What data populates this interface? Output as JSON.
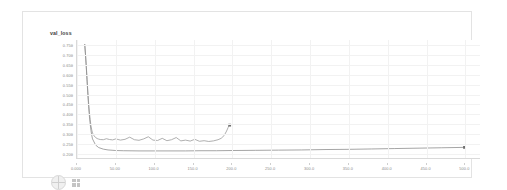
{
  "panel": {
    "name": "chart-card"
  },
  "footer": {
    "avatar_icon": "avatar-icon",
    "grid_icon": "grid-icon"
  },
  "chart_data": {
    "type": "line",
    "title": "val_loss",
    "xlabel": "",
    "ylabel": "",
    "grid": true,
    "legend": "none",
    "xlim": [
      0,
      520
    ],
    "ylim": [
      0.175,
      0.775
    ],
    "x_ticks": [
      0,
      50,
      100,
      150,
      200,
      250,
      300,
      350,
      400,
      450,
      500
    ],
    "x_tick_labels": [
      "0.000",
      "50.00",
      "100.0",
      "150.0",
      "200.0",
      "250.0",
      "300.0",
      "350.0",
      "400.0",
      "450.0",
      "500.0"
    ],
    "y_ticks": [
      0.75,
      0.7,
      0.65,
      0.6,
      0.55,
      0.5,
      0.45,
      0.4,
      0.35,
      0.3,
      0.25,
      0.2
    ],
    "y_tick_labels": [
      "0.750",
      "0.700",
      "0.650",
      "0.600",
      "0.550",
      "0.500",
      "0.450",
      "0.400",
      "0.350",
      "0.300",
      "0.250",
      "0.200"
    ],
    "series": [
      {
        "name": "run-a",
        "color": "#9a9a9a",
        "end_marker": true,
        "x": [
          10,
          11,
          12,
          13,
          14,
          15,
          16,
          17,
          18,
          19,
          20,
          22,
          24,
          26,
          28,
          30,
          34,
          38,
          42,
          46,
          50,
          56,
          62,
          68,
          74,
          80,
          86,
          92,
          98,
          104,
          110,
          116,
          122,
          128,
          134,
          140,
          146,
          152,
          158,
          164,
          170,
          176,
          182,
          186,
          190,
          193,
          195,
          196,
          197
        ],
        "y": [
          0.752,
          0.7,
          0.64,
          0.575,
          0.512,
          0.455,
          0.408,
          0.37,
          0.34,
          0.318,
          0.302,
          0.288,
          0.279,
          0.274,
          0.271,
          0.269,
          0.268,
          0.273,
          0.269,
          0.267,
          0.272,
          0.266,
          0.27,
          0.281,
          0.268,
          0.265,
          0.272,
          0.283,
          0.266,
          0.264,
          0.275,
          0.263,
          0.268,
          0.279,
          0.262,
          0.266,
          0.261,
          0.27,
          0.26,
          0.263,
          0.259,
          0.262,
          0.268,
          0.275,
          0.29,
          0.312,
          0.33,
          0.339,
          0.342
        ]
      },
      {
        "name": "run-b",
        "color": "#8e8e8e",
        "end_marker": true,
        "x": [
          10,
          11,
          12,
          13,
          14,
          15,
          16,
          17,
          18,
          19,
          20,
          24,
          28,
          34,
          40,
          50,
          60,
          80,
          100,
          120,
          140,
          160,
          180,
          200,
          230,
          260,
          290,
          320,
          350,
          380,
          410,
          440,
          470,
          500
        ],
        "y": [
          0.752,
          0.698,
          0.635,
          0.566,
          0.498,
          0.438,
          0.388,
          0.348,
          0.316,
          0.291,
          0.272,
          0.241,
          0.228,
          0.22,
          0.216,
          0.213,
          0.212,
          0.211,
          0.211,
          0.211,
          0.211,
          0.212,
          0.212,
          0.213,
          0.214,
          0.215,
          0.216,
          0.218,
          0.219,
          0.221,
          0.223,
          0.225,
          0.227,
          0.229
        ]
      }
    ]
  }
}
